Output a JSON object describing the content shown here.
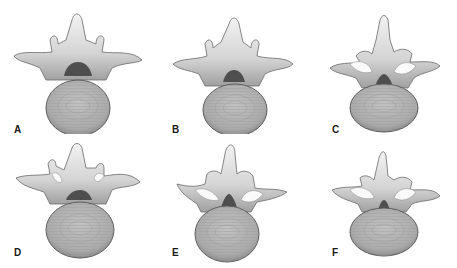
{
  "figure": {
    "panels": [
      {
        "label": "A",
        "variant": "normal-canal"
      },
      {
        "label": "B",
        "variant": "mild-narrowing"
      },
      {
        "label": "C",
        "variant": "facet-hypertrophy"
      },
      {
        "label": "D",
        "variant": "lateral-recess"
      },
      {
        "label": "E",
        "variant": "central-stenosis"
      },
      {
        "label": "F",
        "variant": "severe-stenosis"
      }
    ]
  },
  "colors": {
    "bone_light": "#e6e6e6",
    "bone_shadow": "#9a9a9a",
    "body_fill": "#b4b4b4",
    "body_ring": "#9c9c9c",
    "outline": "#5a5a5a",
    "canal": "#4e4e4e",
    "highlight": "#fafafa"
  }
}
